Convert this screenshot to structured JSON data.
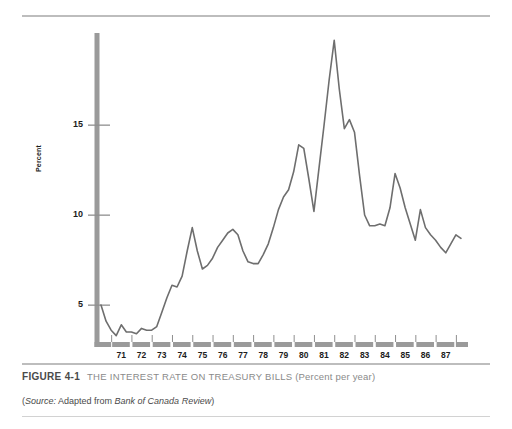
{
  "figure": {
    "number": "FIGURE 4-1",
    "title": "THE INTEREST RATE ON TREASURY BILLS",
    "subtitle": "(Percent per year)",
    "source_prefix": "(",
    "source_label": "Source:",
    "source_text": " Adapted from ",
    "source_publication": "Bank of Canada Review",
    "source_suffix": ")"
  },
  "colors": {
    "axis_bar": "#9a9a9a",
    "series_line": "#6e6e6e",
    "rule": "#bdbdbd",
    "caption_gray": "#8a8a8a",
    "text": "#1c1c1c",
    "background": "#ffffff"
  },
  "chart_data": {
    "type": "line",
    "title": "THE INTEREST RATE ON TREASURY BILLS (Percent per year)",
    "xlabel": "",
    "ylabel": "Percent",
    "ylim": [
      0,
      20
    ],
    "xlim": [
      1970.0,
      1987.75
    ],
    "grid": false,
    "legend": "none",
    "ytick_labels": [
      "5",
      "10",
      "15"
    ],
    "yticks": [
      5,
      10,
      15
    ],
    "xtick_labels": [
      "71",
      "72",
      "73",
      "74",
      "75",
      "76",
      "77",
      "78",
      "79",
      "80",
      "81",
      "82",
      "83",
      "84",
      "85",
      "86",
      "87"
    ],
    "xticks": [
      1971,
      1972,
      1973,
      1974,
      1975,
      1976,
      1977,
      1978,
      1979,
      1980,
      1981,
      1982,
      1983,
      1984,
      1985,
      1986,
      1987
    ],
    "series": [
      {
        "name": "Treasury bill rate",
        "x": [
          1970.0,
          1970.25,
          1970.5,
          1970.75,
          1971.0,
          1971.25,
          1971.5,
          1971.75,
          1972.0,
          1972.25,
          1972.5,
          1972.75,
          1973.0,
          1973.25,
          1973.5,
          1973.75,
          1974.0,
          1974.25,
          1974.5,
          1974.75,
          1975.0,
          1975.25,
          1975.5,
          1975.75,
          1976.0,
          1976.25,
          1976.5,
          1976.75,
          1977.0,
          1977.25,
          1977.5,
          1977.75,
          1978.0,
          1978.25,
          1978.5,
          1978.75,
          1979.0,
          1979.25,
          1979.5,
          1979.75,
          1980.0,
          1980.25,
          1980.5,
          1980.75,
          1981.0,
          1981.25,
          1981.5,
          1981.75,
          1982.0,
          1982.25,
          1982.5,
          1982.75,
          1983.0,
          1983.25,
          1983.5,
          1983.75,
          1984.0,
          1984.25,
          1984.5,
          1984.75,
          1985.0,
          1985.25,
          1985.5,
          1985.75,
          1986.0,
          1986.25,
          1986.5,
          1986.75,
          1987.0,
          1987.25,
          1987.5,
          1987.75
        ],
        "values": [
          5.0,
          4.1,
          3.6,
          3.3,
          3.9,
          3.5,
          3.5,
          3.4,
          3.7,
          3.6,
          3.6,
          3.8,
          4.6,
          5.4,
          6.1,
          6.0,
          6.6,
          8.0,
          9.3,
          8.0,
          7.0,
          7.2,
          7.6,
          8.2,
          8.6,
          9.0,
          9.2,
          8.9,
          8.0,
          7.4,
          7.3,
          7.3,
          7.8,
          8.4,
          9.3,
          10.3,
          11.0,
          11.4,
          12.4,
          13.9,
          13.7,
          12.0,
          10.2,
          12.6,
          15.0,
          17.5,
          19.7,
          17.0,
          14.8,
          15.3,
          14.6,
          12.2,
          10.0,
          9.4,
          9.4,
          9.5,
          9.4,
          10.4,
          12.3,
          11.5,
          10.4,
          9.5,
          8.6,
          10.3,
          9.3,
          8.9,
          8.6,
          8.2,
          7.9,
          8.4,
          8.9,
          8.7
        ]
      }
    ],
    "annotations": [
      {
        "label": "peak",
        "x": 1981.5,
        "y": 19.7
      },
      {
        "label": "trough",
        "x": 1970.75,
        "y": 3.3
      }
    ]
  }
}
